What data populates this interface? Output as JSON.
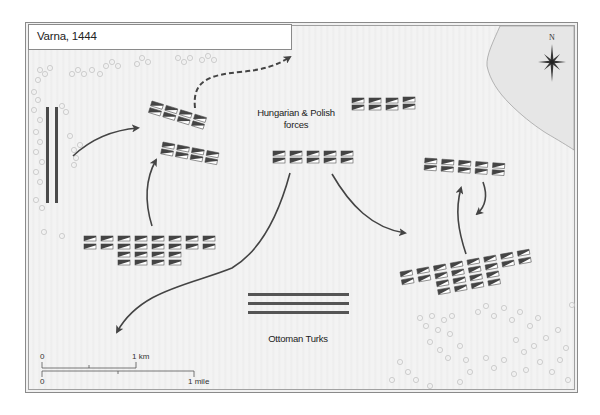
{
  "map": {
    "title": "Varna, 1444",
    "compass": {
      "north_label": "N"
    },
    "labels": {
      "hungarian_polish": "Hungarian & Polish forces",
      "hungarian_polish_line1": "Hungarian & Polish",
      "hungarian_polish_line2": "forces",
      "ottoman": "Ottoman Turks"
    },
    "scale": {
      "km_zero": "0",
      "km_label": "1 km",
      "mile_zero": "0",
      "mile_label": "1 mile"
    },
    "colors": {
      "background": "#f1f1f1",
      "sea": "#e6e6e6",
      "unit_dark": "#444444",
      "arrow": "#444444",
      "ottoman_bar": "#555555",
      "woods": "#c8c8c8"
    },
    "units": [
      {
        "name": "hungarian-unit-upper-left",
        "rows": 2,
        "cols": 4,
        "angle": 15
      },
      {
        "name": "hungarian-unit-left-middle",
        "rows": 2,
        "cols": 4,
        "angle": 10
      },
      {
        "name": "hungarian-unit-center",
        "rows": 2,
        "cols": 5,
        "angle": 0
      },
      {
        "name": "hungarian-unit-upper-right",
        "rows": 2,
        "cols": 4,
        "angle": -3
      },
      {
        "name": "hungarian-unit-right",
        "rows": 2,
        "cols": 5,
        "angle": 5
      },
      {
        "name": "hungarian-unit-lower-left",
        "rows": 4,
        "cols": 8
      },
      {
        "name": "hungarian-unit-lower-right",
        "rows": 4,
        "cols": 8,
        "angle": -10
      }
    ],
    "ottoman_lines": 3,
    "left_bars": 2
  }
}
